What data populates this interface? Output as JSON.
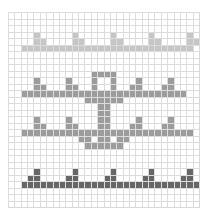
{
  "pattern": {
    "cols": 30,
    "rows": 30,
    "colors": {
      "light": "#c6c6c6",
      "mid": "#9c9c9c",
      "dark": "#666666",
      "grid_line": "#dcdcdc",
      "background": "#ffffff"
    },
    "rows_map": [
      "..............................",
      "..............................",
      "..............................",
      "....L.....L.....L.....L.....L.",
      "....LL....LL....LL....LL....LL",
      "..LLLLLLLLLLLLLLLLLLLLLLLLLLL.",
      "..............................",
      "..............................",
      "..............................",
      ".............MMMM.............",
      "....M....M...M..M...M....M....",
      "....MM...MM..M..M..MM...MM....",
      "..MMMMMMMMMMMMMMMMMMMMMMMMMM..",
      "............MMMMMM............",
      "..............MM..............",
      "..............MM..............",
      "....M....M....MM....M....M....",
      "....MM...MM...MM...MM...MM....",
      "..MMMMMMMMMMMMMMMMMMMMMMMMMMM.",
      "...........MM.MM.MM...........",
      "............MMMMMM............",
      "..............................",
      "..............................",
      "..............................",
      "....D.....D.....D.....D.....D.",
      "...DD....DD....DD....DD....DD.",
      "..DDDDDDDDDDDDDDDDDDDDDDDDDDDD",
      "..............................",
      "..............................",
      ".............................."
    ]
  }
}
